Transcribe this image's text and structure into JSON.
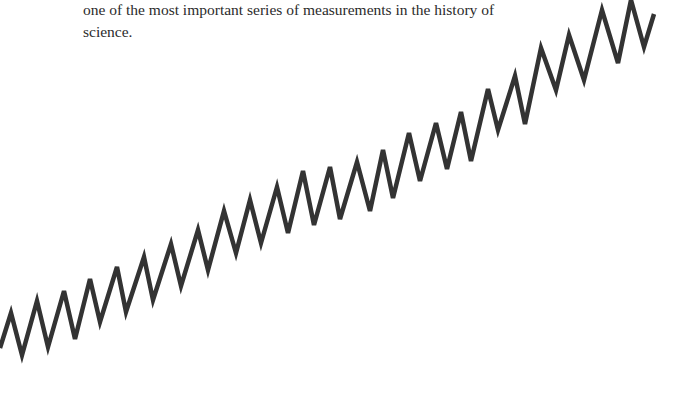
{
  "caption": {
    "line1": "one of the most important series of measurements in the history of",
    "line2": "science."
  },
  "style": {
    "line_color": "#333333",
    "background": "#ffffff"
  },
  "chart_data": {
    "type": "line",
    "title": "",
    "xlabel": "",
    "ylabel": "",
    "grid": false,
    "legend": null,
    "series": [
      {
        "name": "measurement",
        "points": [
          [
            0,
            348
          ],
          [
            11,
            313
          ],
          [
            22,
            355
          ],
          [
            37,
            301
          ],
          [
            48,
            347
          ],
          [
            64,
            291
          ],
          [
            75,
            339
          ],
          [
            90,
            279
          ],
          [
            100,
            322
          ],
          [
            117,
            267
          ],
          [
            126,
            312
          ],
          [
            144,
            257
          ],
          [
            153,
            300
          ],
          [
            171,
            244
          ],
          [
            181,
            286
          ],
          [
            198,
            230
          ],
          [
            208,
            270
          ],
          [
            224,
            211
          ],
          [
            236,
            253
          ],
          [
            250,
            200
          ],
          [
            261,
            243
          ],
          [
            277,
            187
          ],
          [
            288,
            233
          ],
          [
            303,
            171
          ],
          [
            314,
            225
          ],
          [
            330,
            167
          ],
          [
            340,
            219
          ],
          [
            357,
            162
          ],
          [
            370,
            211
          ],
          [
            383,
            150
          ],
          [
            393,
            198
          ],
          [
            409,
            133
          ],
          [
            420,
            181
          ],
          [
            436,
            123
          ],
          [
            447,
            169
          ],
          [
            461,
            112
          ],
          [
            471,
            161
          ],
          [
            488,
            89
          ],
          [
            498,
            130
          ],
          [
            515,
            76
          ],
          [
            525,
            124
          ],
          [
            541,
            48
          ],
          [
            556,
            90
          ],
          [
            569,
            35
          ],
          [
            584,
            80
          ],
          [
            602,
            10
          ],
          [
            618,
            63
          ],
          [
            631,
            0
          ],
          [
            644,
            47
          ],
          [
            654,
            14
          ]
        ]
      }
    ]
  }
}
